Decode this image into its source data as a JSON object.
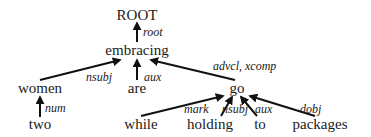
{
  "diagram": {
    "type": "dependency-parse-tree",
    "colors": {
      "ink": "#111111",
      "background": "#ffffff"
    },
    "nodes": [
      {
        "id": "ROOT",
        "label": "ROOT",
        "x": 137,
        "y": 20
      },
      {
        "id": "embracing",
        "label": "embracing",
        "x": 137,
        "y": 55
      },
      {
        "id": "women",
        "label": "women",
        "x": 40,
        "y": 93
      },
      {
        "id": "are",
        "label": "are",
        "x": 137,
        "y": 93
      },
      {
        "id": "go",
        "label": "go",
        "x": 237,
        "y": 93
      },
      {
        "id": "two",
        "label": "two",
        "x": 40,
        "y": 129
      },
      {
        "id": "while",
        "label": "while",
        "x": 141,
        "y": 129
      },
      {
        "id": "holding",
        "label": "holding",
        "x": 210,
        "y": 129
      },
      {
        "id": "to",
        "label": "to",
        "x": 260,
        "y": 129
      },
      {
        "id": "packages",
        "label": "packages",
        "x": 320,
        "y": 129
      }
    ],
    "edges": [
      {
        "from": "embracing",
        "to": "ROOT",
        "label": "root",
        "x1": 137,
        "y1": 42,
        "x2": 137,
        "y2": 23,
        "lx": 143,
        "ly": 36
      },
      {
        "from": "women",
        "to": "embracing",
        "label": "nsubj",
        "x1": 40,
        "y1": 80,
        "x2": 120,
        "y2": 60,
        "lx": 86,
        "ly": 81
      },
      {
        "from": "are",
        "to": "embracing",
        "label": "aux",
        "x1": 137,
        "y1": 80,
        "x2": 137,
        "y2": 60,
        "lx": 144,
        "ly": 81
      },
      {
        "from": "go",
        "to": "embracing",
        "label": "advcl, xcomp",
        "x1": 235,
        "y1": 80,
        "x2": 151,
        "y2": 60,
        "lx": 213,
        "ly": 70
      },
      {
        "from": "two",
        "to": "women",
        "label": "num",
        "x1": 40,
        "y1": 117,
        "x2": 40,
        "y2": 97,
        "lx": 45,
        "ly": 112
      },
      {
        "from": "while",
        "to": "go",
        "label": "mark",
        "x1": 141,
        "y1": 116,
        "x2": 223,
        "y2": 96,
        "lx": 184,
        "ly": 113
      },
      {
        "from": "holding",
        "to": "go",
        "label": "nsubj",
        "x1": 221,
        "y1": 116,
        "x2": 232,
        "y2": 97,
        "lx": 222,
        "ly": 113
      },
      {
        "from": "to",
        "to": "go",
        "label": "aux",
        "x1": 257,
        "y1": 116,
        "x2": 241,
        "y2": 97,
        "lx": 255,
        "ly": 113
      },
      {
        "from": "packages",
        "to": "go",
        "label": "dobj",
        "x1": 315,
        "y1": 116,
        "x2": 250,
        "y2": 96,
        "lx": 300,
        "ly": 113
      }
    ]
  }
}
